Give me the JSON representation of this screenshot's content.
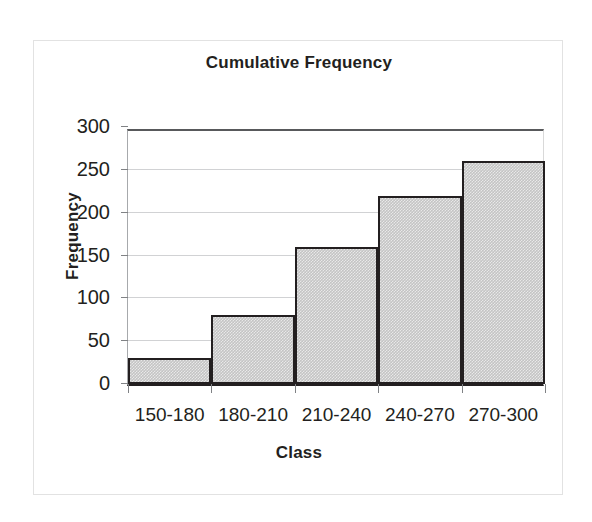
{
  "chart_data": {
    "type": "bar",
    "title": "Cumulative Frequency",
    "xlabel": "Class",
    "ylabel": "Frequency",
    "categories": [
      "150-180",
      "180-210",
      "210-240",
      "240-270",
      "270-300"
    ],
    "values": [
      30,
      80,
      160,
      220,
      260
    ],
    "ylim": [
      0,
      300
    ],
    "yticks": [
      0,
      50,
      100,
      150,
      200,
      250,
      300
    ],
    "ytick_labels": [
      "0",
      "50",
      "100",
      "150",
      "200",
      "250",
      "300"
    ],
    "grid": true,
    "legend": false,
    "bar_fill_color": "#c4c4c4",
    "bar_border_color": "#231f20",
    "gridline_color": "#d1d2d4",
    "text_color": "#231f20",
    "background_color": "#ffffff",
    "frame_border_color": "#e2e2e2",
    "bars_touching": true
  }
}
